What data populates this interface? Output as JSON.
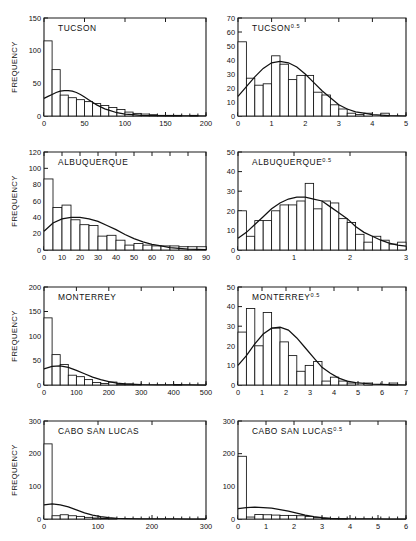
{
  "figure": {
    "axis_label_y": "FREQUENCY",
    "columns": 2,
    "rows": 4,
    "background": "#ffffff",
    "ink_color": "#111111"
  },
  "chart_data": [
    {
      "type": "bar",
      "id": "tucson-raw",
      "title": "TUCSON",
      "title_base": "TUCSON",
      "title_sup": "",
      "xlabel": "",
      "ylabel": "FREQUENCY",
      "xlim": [
        0,
        200
      ],
      "ylim": [
        0,
        150
      ],
      "xticks": [
        0,
        50,
        100,
        150,
        200
      ],
      "xticklabels": [
        "0",
        "50",
        "100",
        "150",
        "200"
      ],
      "yticks": [
        0,
        50,
        100,
        150
      ],
      "yticklabels": [
        "0",
        "50",
        "100",
        "150"
      ],
      "minor_xticks_step": 10,
      "grid": false,
      "bin_width": 10,
      "bin_start": 0,
      "values": [
        115,
        71,
        32,
        28,
        25,
        22,
        19,
        16,
        13,
        10,
        6,
        4,
        3,
        2,
        1,
        1,
        1,
        0,
        1,
        0
      ],
      "curve": {
        "name": "fitted gamma density",
        "x": [
          0,
          5,
          10,
          15,
          20,
          25,
          30,
          35,
          40,
          45,
          50,
          55,
          60,
          65,
          70,
          75,
          80,
          90,
          100,
          110,
          120,
          140,
          160,
          180,
          200
        ],
        "y": [
          27,
          30,
          33,
          36,
          38,
          39,
          39,
          38,
          36,
          33,
          29,
          25,
          21,
          17,
          14,
          11,
          9,
          5,
          3,
          2,
          1,
          0.5,
          0.2,
          0.1,
          0
        ]
      }
    },
    {
      "type": "bar",
      "id": "tucson-sqrt",
      "title": "TUCSON0.5",
      "title_base": "TUCSON",
      "title_sup": "0.5",
      "xlabel": "",
      "ylabel": "",
      "xlim": [
        0,
        5
      ],
      "ylim": [
        0,
        70
      ],
      "xticks": [
        0,
        1,
        2,
        3,
        4,
        5
      ],
      "xticklabels": [
        "0",
        "1",
        "2",
        "3",
        "4",
        "5"
      ],
      "yticks": [
        0,
        10,
        20,
        30,
        40,
        50,
        60,
        70
      ],
      "yticklabels": [
        "0",
        "10",
        "20",
        "30",
        "40",
        "50",
        "60",
        "70"
      ],
      "minor_xticks_step": 0.25,
      "grid": false,
      "bin_width": 0.25,
      "bin_start": 0,
      "values": [
        53,
        27,
        22,
        23,
        43,
        37,
        26,
        29,
        29,
        17,
        15,
        8,
        5,
        2,
        1,
        2,
        0,
        2,
        0,
        0
      ],
      "curve": {
        "name": "fitted normal density",
        "x": [
          0,
          0.25,
          0.5,
          0.75,
          1.0,
          1.25,
          1.5,
          1.75,
          2.0,
          2.25,
          2.5,
          2.75,
          3.0,
          3.25,
          3.5,
          3.75,
          4.0,
          4.5,
          5.0
        ],
        "y": [
          14,
          21,
          28,
          34,
          38,
          39,
          38,
          35,
          30,
          24,
          18,
          13,
          8,
          5,
          3,
          2,
          1,
          0.3,
          0
        ]
      }
    },
    {
      "type": "bar",
      "id": "albuquerque-raw",
      "title": "ALBUQUERQUE",
      "title_base": "ALBUQUERQUE",
      "title_sup": "",
      "xlabel": "",
      "ylabel": "FREQUENCY",
      "xlim": [
        0,
        90
      ],
      "ylim": [
        0,
        120
      ],
      "xticks": [
        0,
        10,
        20,
        30,
        40,
        50,
        60,
        70,
        80,
        90
      ],
      "xticklabels": [
        "0",
        "10",
        "20",
        "30",
        "40",
        "50",
        "60",
        "70",
        "80",
        "90"
      ],
      "yticks": [
        0,
        20,
        40,
        60,
        80,
        100,
        120
      ],
      "yticklabels": [
        "0",
        "20",
        "40",
        "60",
        "80",
        "100",
        "120"
      ],
      "minor_xticks_step": 5,
      "grid": false,
      "bin_width": 5,
      "bin_start": 0,
      "values": [
        87,
        52,
        55,
        37,
        31,
        30,
        17,
        18,
        12,
        6,
        8,
        6,
        5,
        5,
        5,
        4,
        4,
        4
      ],
      "curve": {
        "name": "fitted gamma density",
        "x": [
          0,
          5,
          10,
          15,
          20,
          25,
          30,
          35,
          40,
          45,
          50,
          55,
          60,
          65,
          70,
          80,
          90
        ],
        "y": [
          23,
          33,
          38,
          40,
          40,
          38,
          35,
          30,
          25,
          19,
          14,
          10,
          7,
          5,
          3,
          1.2,
          0.4
        ]
      }
    },
    {
      "type": "bar",
      "id": "albuquerque-sqrt",
      "title": "ALBUQUERQUE0.5",
      "title_base": "ALBUQUERQUE",
      "title_sup": "0.5",
      "xlabel": "",
      "ylabel": "",
      "xlim": [
        0,
        3
      ],
      "ylim": [
        0,
        50
      ],
      "xticks": [
        0,
        1,
        2,
        3
      ],
      "xticklabels": [
        "0",
        "1",
        "2",
        "3"
      ],
      "yticks": [
        0,
        10,
        20,
        30,
        40,
        50
      ],
      "yticklabels": [
        "0",
        "10",
        "20",
        "30",
        "40",
        "50"
      ],
      "minor_xticks_step": 0.15,
      "grid": false,
      "bin_width": 0.15,
      "bin_start": 0,
      "values": [
        20,
        7,
        15,
        15,
        20,
        23,
        23,
        25,
        34,
        21,
        25,
        24,
        16,
        14,
        8,
        4,
        7,
        5,
        3,
        4
      ],
      "curve": {
        "name": "fitted normal density",
        "x": [
          0,
          0.15,
          0.3,
          0.45,
          0.6,
          0.75,
          0.9,
          1.05,
          1.2,
          1.35,
          1.5,
          1.65,
          1.8,
          1.95,
          2.1,
          2.25,
          2.4,
          2.55,
          2.7,
          2.85,
          3.0
        ],
        "y": [
          6,
          9,
          13,
          17,
          21,
          24,
          26,
          27,
          27,
          26,
          25,
          22,
          19,
          16,
          12,
          9,
          7,
          5,
          3.5,
          2.5,
          2
        ]
      }
    },
    {
      "type": "bar",
      "id": "monterrey-raw",
      "title": "MONTERREY",
      "title_base": "MONTERREY",
      "title_sup": "",
      "xlabel": "",
      "ylabel": "FREQUENCY",
      "xlim": [
        0,
        500
      ],
      "ylim": [
        0,
        200
      ],
      "xticks": [
        0,
        100,
        200,
        300,
        400,
        500
      ],
      "xticklabels": [
        "0",
        "100",
        "200",
        "300",
        "400",
        "500"
      ],
      "yticks": [
        0,
        50,
        100,
        150,
        200
      ],
      "yticklabels": [
        "0",
        "50",
        "100",
        "150",
        "200"
      ],
      "minor_xticks_step": 25,
      "grid": false,
      "bin_width": 25,
      "bin_start": 0,
      "values": [
        137,
        62,
        42,
        20,
        17,
        11,
        5,
        3,
        6,
        2,
        2,
        1,
        0,
        0,
        0,
        0,
        1,
        0,
        0,
        0
      ],
      "curve": {
        "name": "fitted gamma density",
        "x": [
          0,
          25,
          50,
          75,
          100,
          125,
          150,
          175,
          200,
          225,
          250,
          300,
          350,
          400,
          450,
          500
        ],
        "y": [
          33,
          38,
          39,
          36,
          30,
          23,
          16,
          11,
          7,
          4,
          2.5,
          1,
          0.4,
          0.2,
          0.1,
          0
        ]
      }
    },
    {
      "type": "bar",
      "id": "monterrey-sqrt",
      "title": "MONTERREY0.5",
      "title_base": "MONTERREY",
      "title_sup": "0.5",
      "xlabel": "",
      "ylabel": "",
      "xlim": [
        0,
        7
      ],
      "ylim": [
        0,
        50
      ],
      "xticks": [
        0,
        1,
        2,
        3,
        4,
        5,
        6,
        7
      ],
      "xticklabels": [
        "0",
        "1",
        "2",
        "3",
        "4",
        "5",
        "6",
        "7"
      ],
      "yticks": [
        0,
        10,
        20,
        30,
        40,
        50
      ],
      "yticklabels": [
        "0",
        "10",
        "20",
        "30",
        "40",
        "50"
      ],
      "minor_xticks_step": 0.35,
      "grid": false,
      "bin_width": 0.35,
      "bin_start": 0,
      "values": [
        27,
        39,
        20,
        37,
        29,
        22,
        15,
        7,
        10,
        12,
        2,
        4,
        2,
        1,
        0,
        1,
        0,
        0,
        1,
        0
      ],
      "curve": {
        "name": "fitted normal density",
        "x": [
          0,
          0.35,
          0.7,
          1.05,
          1.4,
          1.75,
          2.1,
          2.45,
          2.8,
          3.15,
          3.5,
          3.85,
          4.2,
          4.55,
          4.9,
          5.25,
          5.6,
          6.3,
          7.0
        ],
        "y": [
          10,
          15,
          21,
          26,
          29,
          29.5,
          28,
          24,
          19,
          14,
          9,
          6,
          3.5,
          2,
          1.2,
          0.8,
          0.5,
          0.2,
          0
        ]
      }
    },
    {
      "type": "bar",
      "id": "cabo-raw",
      "title": "CABO SAN LUCAS",
      "title_base": "CABO SAN LUCAS",
      "title_sup": "",
      "xlabel": "",
      "ylabel": "FREQUENCY",
      "xlim": [
        0,
        300
      ],
      "ylim": [
        0,
        300
      ],
      "xticks": [
        0,
        100,
        200,
        300
      ],
      "xticklabels": [
        "0",
        "100",
        "200",
        "300"
      ],
      "yticks": [
        0,
        100,
        200,
        300
      ],
      "yticklabels": [
        "0",
        "100",
        "200",
        "300"
      ],
      "minor_xticks_step": 15,
      "grid": false,
      "bin_width": 15,
      "bin_start": 0,
      "values": [
        230,
        10,
        13,
        10,
        8,
        5,
        3,
        2,
        1,
        0,
        0,
        0,
        0,
        0,
        0,
        0,
        0,
        0,
        0,
        0
      ],
      "curve": {
        "name": "fitted gamma density",
        "x": [
          0,
          15,
          30,
          45,
          60,
          75,
          90,
          105,
          120,
          135,
          150,
          180,
          210,
          240,
          270,
          300
        ],
        "y": [
          43,
          46,
          43,
          37,
          28,
          19,
          12,
          7,
          4,
          2,
          1.2,
          0.4,
          0.2,
          0.1,
          0,
          0
        ]
      }
    },
    {
      "type": "bar",
      "id": "cabo-sqrt",
      "title": "CABO SAN LUCAS0.5",
      "title_base": "CABO SAN LUCAS",
      "title_sup": "0.5",
      "xlabel": "",
      "ylabel": "",
      "xlim": [
        0,
        6
      ],
      "ylim": [
        0,
        300
      ],
      "xticks": [
        0,
        1,
        2,
        3,
        4,
        5,
        6
      ],
      "xticklabels": [
        "0",
        "1",
        "2",
        "3",
        "4",
        "5",
        "6"
      ],
      "yticks": [
        0,
        100,
        200,
        300
      ],
      "yticklabels": [
        "0",
        "100",
        "200",
        "300"
      ],
      "minor_xticks_step": 0.3,
      "grid": false,
      "bin_width": 0.3,
      "bin_start": 0,
      "values": [
        192,
        6,
        14,
        13,
        12,
        11,
        11,
        10,
        8,
        4,
        2,
        1,
        1,
        0,
        0,
        0,
        0,
        0,
        0,
        0
      ],
      "curve": {
        "name": "fitted normal density",
        "x": [
          0,
          0.3,
          0.6,
          0.9,
          1.2,
          1.5,
          1.8,
          2.1,
          2.4,
          2.7,
          3.0,
          3.3,
          3.6,
          4.2,
          4.8,
          5.4,
          6.0
        ],
        "y": [
          32,
          35,
          36,
          35,
          33,
          29,
          24,
          18,
          12,
          7,
          4,
          2,
          1,
          0.4,
          0.1,
          0,
          0
        ]
      }
    }
  ]
}
